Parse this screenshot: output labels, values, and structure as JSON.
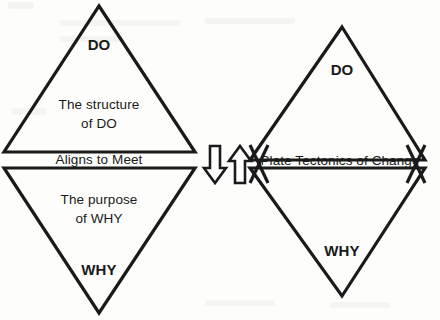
{
  "diagram": {
    "background_color": "#fdfdfb",
    "stroke_color": "#1a1a1a",
    "text_color": "#1a1a1a"
  },
  "left_figure": {
    "name": "aligned-hourglass",
    "top_triangle": {
      "heading": "DO",
      "body_line1": "The structure",
      "body_line2": "of DO"
    },
    "bottom_triangle": {
      "heading": "WHY",
      "body_line1": "The purpose",
      "body_line2": "of WHY"
    },
    "band_label": "Aligns to Meet"
  },
  "right_figure": {
    "name": "plate-tectonics-diamond",
    "top_triangle": {
      "heading": "DO"
    },
    "bottom_triangle": {
      "heading": "WHY"
    },
    "band_label": "Plate Tectonics of Change"
  },
  "connectors": {
    "down_arrow": "down-arrow",
    "up_arrow": "up-arrow"
  }
}
